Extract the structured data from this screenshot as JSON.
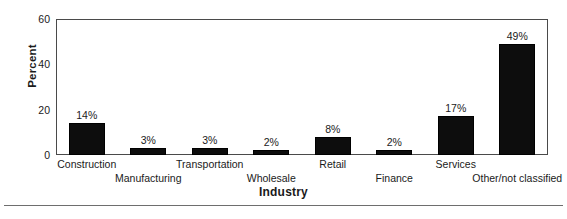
{
  "chart_data": {
    "type": "bar",
    "title": "",
    "xlabel": "Industry",
    "ylabel": "Percent",
    "ylim": [
      0,
      60
    ],
    "yticks": [
      0,
      20,
      40,
      60
    ],
    "grid": false,
    "legend": null,
    "categories": [
      "Construction",
      "Manufacturing",
      "Transportation",
      "Wholesale",
      "Retail",
      "Finance",
      "Services",
      "Other/not classified"
    ],
    "values": [
      14,
      3,
      3,
      2,
      8,
      2,
      17,
      49
    ],
    "data_labels": [
      "14%",
      "3%",
      "3%",
      "2%",
      "8%",
      "2%",
      "17%",
      "49%"
    ],
    "bar_color": "#0d0d0d",
    "axis_color": "#4a4a4a",
    "label_rows": [
      "a",
      "b",
      "a",
      "b",
      "a",
      "b",
      "a",
      "b"
    ]
  }
}
